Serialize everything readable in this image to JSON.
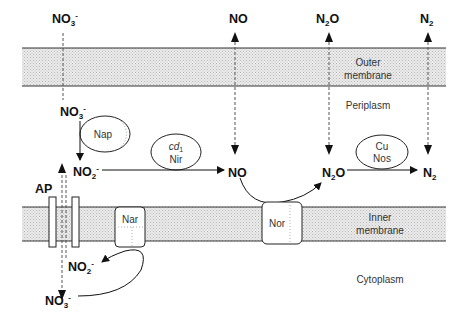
{
  "diagram": {
    "compartments": {
      "outer_membrane": [
        "Outer",
        "membrane"
      ],
      "periplasm": "Periplasm",
      "inner_membrane": [
        "Inner",
        "membrane"
      ],
      "cytoplasm": "Cytoplasm"
    },
    "external_species": {
      "no3": {
        "base": "NO",
        "sub": "3",
        "sup": "-"
      },
      "no": {
        "base": "NO"
      },
      "n2o": {
        "pre": "N",
        "sub": "2",
        "post": "O"
      },
      "n2": {
        "base": "N",
        "sub": "2"
      }
    },
    "periplasm_species": {
      "no3": {
        "base": "NO",
        "sub": "3",
        "sup": "-"
      },
      "no2": {
        "base": "NO",
        "sub": "2",
        "sup": "-"
      },
      "no": {
        "base": "NO"
      },
      "n2o": {
        "pre": "N",
        "sub": "2",
        "post": "O"
      },
      "n2": {
        "base": "N",
        "sub": "2"
      }
    },
    "cytoplasm_species": {
      "no2": {
        "base": "NO",
        "sub": "2",
        "sup": "-"
      },
      "no3": {
        "base": "NO",
        "sub": "3",
        "sup": "-"
      }
    },
    "enzymes": {
      "nap": "Nap",
      "nir": {
        "line1_base": "cd",
        "line1_sub": "1",
        "line2": "Nir"
      },
      "nos": {
        "line1": "Cu",
        "line2": "Nos"
      },
      "nar": "Nar",
      "nor": "Nor"
    },
    "transporter": "AP",
    "colors": {
      "line": "#222222",
      "membrane_fill": "#e4e4e4",
      "dotted": "#555555"
    }
  }
}
